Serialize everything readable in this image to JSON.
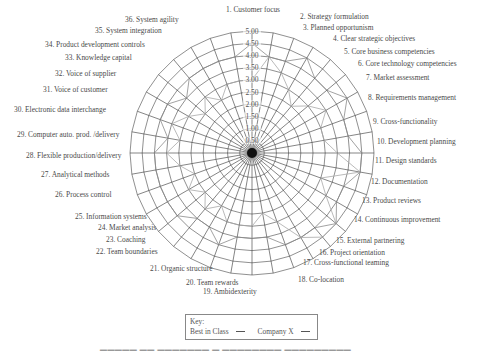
{
  "chart_data": {
    "type": "radar",
    "title": "",
    "center": [
      252,
      153
    ],
    "radius_px": 122,
    "rmax": 5.0,
    "ring_step": 0.5,
    "radial_ticks": [
      "5.00",
      "4.50",
      "4.00",
      "3.50",
      "3.00",
      "2.50",
      "2.00",
      "1.50",
      "1.00",
      "0.50"
    ],
    "categories": [
      "1. Customer focus",
      "2. Strategy formulation",
      "3. Planned opportunism",
      "4. Clear strategic objectives",
      "5. Core business competencies",
      "6. Core technology competencies",
      "7. Market assessment",
      "8. Requirements management",
      "9. Cross-functionality",
      "10. Development planning",
      "11. Design standards",
      "12. Documentation",
      "13. Product reviews",
      "14. Continuous improvement",
      "15. External partnering",
      "16. Project orientation",
      "17. Cross-functional teaming",
      "18. Co-location",
      "19. Ambidexterity",
      "20. Team rewards",
      "21. Organic structure",
      "22. Team boundaries",
      "23. Coaching",
      "24. Market analysis",
      "25. Information systems",
      "26. Process control",
      "27. Analytical methods",
      "28. Flexible production/delivery",
      "29. Computer auto. prod. /delivery",
      "30. Electronic data interchange",
      "31. Voice of customer",
      "32. Voice of supplier",
      "33. Knowledge capital",
      "34. Product development controls",
      "35. System integration",
      "36. System agility"
    ],
    "series": [
      {
        "name": "Best in Class",
        "values": [
          4.5,
          4.0,
          4.0,
          4.5,
          4.0,
          4.0,
          4.5,
          4.0,
          4.0,
          4.5,
          4.5,
          4.0,
          4.0,
          4.5,
          4.0,
          4.0,
          4.0,
          3.5,
          3.5,
          3.5,
          4.0,
          3.5,
          3.5,
          4.0,
          4.0,
          4.0,
          4.0,
          4.0,
          3.5,
          4.0,
          4.0,
          3.5,
          4.0,
          4.0,
          4.0,
          4.0
        ]
      },
      {
        "name": "Company X",
        "values": [
          3.0,
          4.0,
          3.5,
          3.0,
          2.5,
          3.0,
          3.5,
          3.0,
          3.0,
          3.5,
          4.5,
          3.0,
          3.5,
          4.5,
          4.5,
          4.0,
          3.0,
          2.5,
          3.0,
          3.0,
          3.0,
          2.5,
          3.0,
          2.5,
          3.0,
          2.5,
          3.0,
          3.5,
          3.0,
          3.5,
          3.0,
          2.5,
          3.0,
          2.5,
          3.0,
          3.0
        ]
      }
    ],
    "legend": {
      "title": "Key:",
      "entries": [
        "Best in Class",
        "Company X"
      ],
      "position": "bottom-center"
    },
    "grid": true
  },
  "legend": {
    "title": "Key:",
    "best_in_class": "Best in Class",
    "company_x": "Company X"
  },
  "label_positions": [
    [
      253,
      6,
      "center"
    ],
    [
      300,
      13,
      "left"
    ],
    [
      303,
      24,
      "left"
    ],
    [
      333,
      35,
      "left"
    ],
    [
      344,
      48,
      "left"
    ],
    [
      358,
      60,
      "left"
    ],
    [
      366,
      74,
      "left"
    ],
    [
      368,
      94,
      "left"
    ],
    [
      373,
      118,
      "left"
    ],
    [
      377,
      138,
      "left"
    ],
    [
      375,
      157,
      "left"
    ],
    [
      371,
      178,
      "left"
    ],
    [
      362,
      197,
      "left"
    ],
    [
      354,
      216,
      "left"
    ],
    [
      336,
      237,
      "left"
    ],
    [
      319,
      249,
      "left"
    ],
    [
      303,
      259,
      "left"
    ],
    [
      298,
      276,
      "left"
    ],
    [
      203,
      288,
      "left"
    ],
    [
      186,
      279,
      "left"
    ],
    [
      150,
      265,
      "left"
    ],
    [
      96,
      248,
      "left"
    ],
    [
      106,
      236,
      "left"
    ],
    [
      98,
      224,
      "left"
    ],
    [
      75,
      213,
      "left"
    ],
    [
      55,
      191,
      "left"
    ],
    [
      41,
      171,
      "left"
    ],
    [
      26,
      152,
      "left"
    ],
    [
      17,
      131,
      "left"
    ],
    [
      14,
      106,
      "left"
    ],
    [
      43,
      86,
      "left"
    ],
    [
      55,
      70,
      "left"
    ],
    [
      65,
      54,
      "left"
    ],
    [
      45,
      41,
      "left"
    ],
    [
      95,
      27,
      "left"
    ],
    [
      125,
      16,
      "left"
    ]
  ]
}
